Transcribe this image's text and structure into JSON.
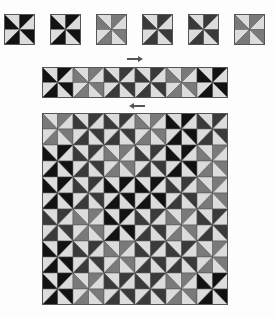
{
  "colors": {
    "black": "#121212",
    "dark": "#3a3a3a",
    "mid": "#7a7a7a",
    "light": "#dcdcdc",
    "outline": "#555555"
  },
  "tiles": [
    {
      "name": "tile-1",
      "dark": "black",
      "x": 4
    },
    {
      "name": "tile-2",
      "dark": "black",
      "x": 50
    },
    {
      "name": "tile-3",
      "dark": "mid",
      "x": 96
    },
    {
      "name": "tile-4",
      "dark": "dark",
      "x": 142
    },
    {
      "name": "tile-5",
      "dark": "dark",
      "x": 188
    },
    {
      "name": "tile-6",
      "dark": "mid",
      "x": 234
    }
  ],
  "tile_row_top": 14,
  "tile_size": 31,
  "arrows": [
    {
      "name": "arrow-right",
      "dir": "right",
      "x": 127,
      "y": 58,
      "w": 14
    },
    {
      "name": "arrow-left",
      "dir": "left",
      "x": 131,
      "y": 105,
      "w": 14
    }
  ],
  "strip": {
    "tiles": [
      "black",
      "mid",
      "dark",
      "dark",
      "mid",
      "black"
    ],
    "cell_w": 15.5,
    "cell_h": 15.5
  },
  "grid": {
    "cell_w": 15.5,
    "cell_h": 16,
    "rows": [
      [
        "mid",
        "dark",
        "dark",
        "mid",
        "black",
        "dark"
      ],
      [
        "black",
        "dark",
        "mid",
        "dark",
        "black",
        "mid"
      ],
      [
        "black",
        "dark",
        "black",
        "black",
        "dark",
        "mid"
      ],
      [
        "dark",
        "mid",
        "black",
        "dark",
        "mid",
        "dark"
      ],
      [
        "black",
        "dark",
        "mid",
        "dark",
        "dark",
        "mid"
      ],
      [
        "black",
        "mid",
        "dark",
        "dark",
        "mid",
        "black"
      ]
    ]
  }
}
